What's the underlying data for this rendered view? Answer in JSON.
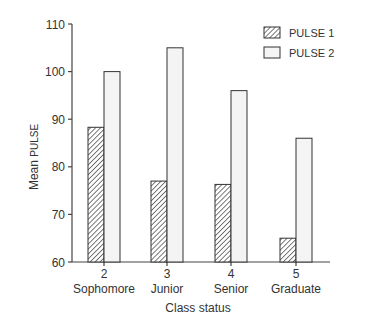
{
  "chart_data": {
    "type": "bar",
    "title": "",
    "xlabel": "Class status",
    "ylabel": "Mean PULSE",
    "ylabel_parts": {
      "main": "Mean ",
      "small": "PULSE"
    },
    "ylim": [
      60,
      110
    ],
    "yticks": [
      60,
      70,
      80,
      90,
      100,
      110
    ],
    "grid": false,
    "legend_position": "top-right",
    "categories": [
      {
        "code": "2",
        "name": "Sophomore"
      },
      {
        "code": "3",
        "name": "Junior"
      },
      {
        "code": "4",
        "name": "Senior"
      },
      {
        "code": "5",
        "name": "Graduate"
      }
    ],
    "series": [
      {
        "name": "PULSE 1",
        "pattern": "hatched",
        "values": [
          88.3,
          77,
          76.3,
          65
        ]
      },
      {
        "name": "PULSE 2",
        "pattern": "open",
        "values": [
          100,
          105,
          96,
          86
        ]
      }
    ]
  },
  "colors": {
    "axis": "#444444",
    "bar_outline": "#333333",
    "hatch": "#333333",
    "open_fill": "#f4f4f4",
    "text": "#333333"
  }
}
